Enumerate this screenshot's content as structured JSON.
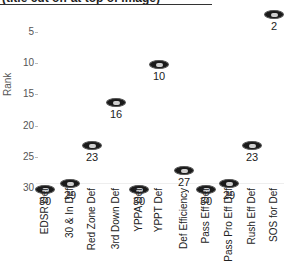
{
  "chart_data": {
    "type": "scatter",
    "title": "(title cut off at top of image)",
    "xlabel": "",
    "ylabel": "Rank",
    "ylim": [
      0,
      32
    ],
    "y_inverted": true,
    "y_ticks": [
      "5",
      "10",
      "15",
      "20",
      "25",
      "30"
    ],
    "grid": false,
    "legend": null,
    "marker": "team-logo-oval",
    "categories": [
      "EDSR Def",
      "30 & In Def",
      "Red Zone Def",
      "3rd Down Def",
      "YPPA Def",
      "YPPT Def",
      "Def Efficiency",
      "Pass Eff Def",
      "Pass Pro Eff Def",
      "Rush Eff Def",
      "SOS for Def"
    ],
    "values": [
      30,
      29,
      23,
      16,
      30,
      10,
      27,
      30,
      29,
      23,
      2
    ]
  },
  "labels": {
    "ylabel": "Rank",
    "yticks": [
      "5",
      "10",
      "15",
      "20",
      "25",
      "30"
    ]
  },
  "points": [
    {
      "category": "EDSR Def",
      "value": "30"
    },
    {
      "category": "30 & In Def",
      "value": "29"
    },
    {
      "category": "Red Zone Def",
      "value": "23"
    },
    {
      "category": "3rd Down Def",
      "value": "16"
    },
    {
      "category": "YPPA Def",
      "value": "30"
    },
    {
      "category": "YPPT Def",
      "value": "10"
    },
    {
      "category": "Def Efficiency",
      "value": "27"
    },
    {
      "category": "Pass Eff Def",
      "value": "30"
    },
    {
      "category": "Pass Pro Eff Def",
      "value": "29"
    },
    {
      "category": "Rush Eff Def",
      "value": "23"
    },
    {
      "category": "SOS for Def",
      "value": "2"
    }
  ]
}
